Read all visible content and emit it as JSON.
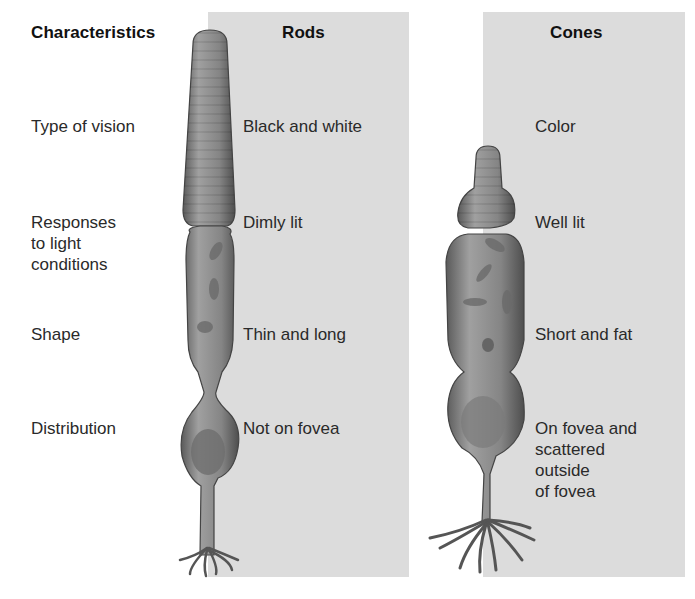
{
  "headers": {
    "characteristics": "Characteristics",
    "rods": "Rods",
    "cones": "Cones"
  },
  "rows": [
    {
      "characteristic": "Type of vision",
      "rods": "Black and white",
      "cones": "Color"
    },
    {
      "characteristic": "Responses\nto light\nconditions",
      "rods": "Dimly lit",
      "cones": "Well lit"
    },
    {
      "characteristic": "Shape",
      "rods": "Thin and long",
      "cones": "Short and fat"
    },
    {
      "characteristic": "Distribution",
      "rods": "Not on fovea",
      "cones": "On fovea and\nscattered\noutside\nof fovea"
    }
  ],
  "illustrations": {
    "rod": "rod-cell",
    "cone": "cone-cell"
  },
  "colors": {
    "panel": "#dcdcdc",
    "cell_fill": "#8a8a8a",
    "cell_dark": "#5e5e5e"
  }
}
